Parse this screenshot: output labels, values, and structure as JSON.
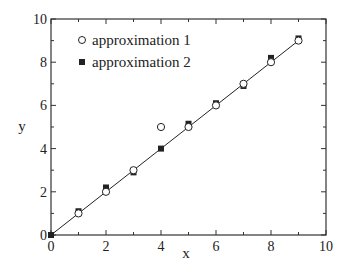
{
  "chart_data": {
    "type": "scatter",
    "title": "",
    "xlabel": "x",
    "ylabel": "y",
    "xlim": [
      0,
      10
    ],
    "ylim": [
      0,
      10
    ],
    "xticks": [
      0,
      2,
      4,
      6,
      8,
      10
    ],
    "yticks": [
      0,
      2,
      4,
      6,
      8,
      10
    ],
    "x_tick_labels": [
      "0",
      "2",
      "4",
      "6",
      "8",
      "10"
    ],
    "y_tick_labels": [
      "0",
      "2",
      "4",
      "6",
      "8",
      "10"
    ],
    "grid": false,
    "legend_position": "upper left",
    "reference_line": {
      "name": "y = x",
      "x": [
        0,
        9
      ],
      "y": [
        0,
        9
      ]
    },
    "series": [
      {
        "name": "approximation 1",
        "marker": "open-circle",
        "x": [
          0,
          1,
          2,
          3,
          4,
          5,
          6,
          7,
          8,
          9
        ],
        "y": [
          0,
          1.0,
          2.0,
          3.0,
          5.0,
          5.0,
          6.0,
          7.0,
          8.0,
          9.0
        ]
      },
      {
        "name": "approximation 2",
        "marker": "filled-square",
        "x": [
          0,
          1,
          2,
          3,
          4,
          5,
          6,
          7,
          8,
          9
        ],
        "y": [
          0,
          1.1,
          2.2,
          2.9,
          4.0,
          5.15,
          6.1,
          6.9,
          8.2,
          9.1
        ]
      }
    ]
  },
  "legend": {
    "item1": "approximation 1",
    "item2": "approximation 2"
  },
  "axes": {
    "xlabel": "x",
    "ylabel": "y",
    "x_ticks": [
      "0",
      "2",
      "4",
      "6",
      "8",
      "10"
    ],
    "y_ticks": [
      "0",
      "2",
      "4",
      "6",
      "8",
      "10"
    ]
  }
}
